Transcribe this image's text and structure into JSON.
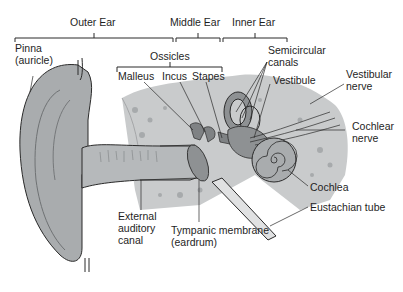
{
  "diagram": {
    "regions": [
      {
        "id": "outer",
        "label": "Outer Ear"
      },
      {
        "id": "middle",
        "label": "Middle Ear"
      },
      {
        "id": "inner",
        "label": "Inner Ear"
      }
    ],
    "labels": {
      "pinna_line1": "Pinna",
      "pinna_line2": "(auricle)",
      "ossicles": "Ossicles",
      "malleus": "Malleus",
      "incus": "Incus",
      "stapes": "Stapes",
      "semicircular_line1": "Semicircular",
      "semicircular_line2": "canals",
      "vestibule": "Vestibule",
      "vestibular_line1": "Vestibular",
      "vestibular_line2": "nerve",
      "cochlear_line1": "Cochlear",
      "cochlear_line2": "nerve",
      "cochlea": "Cochlea",
      "eustachian": "Eustachian tube",
      "external_line1": "External",
      "external_line2": "auditory",
      "external_line3": "canal",
      "tympanic_line1": "Tympanic membrane",
      "tympanic_line2": "(eardrum)"
    },
    "colors": {
      "tissue": "#a9acae",
      "tissue_dark": "#8e9193",
      "bone": "#c9cbcc",
      "outline": "#2a2a2a",
      "background": "#ffffff"
    }
  }
}
